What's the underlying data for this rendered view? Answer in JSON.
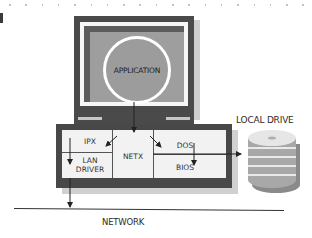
{
  "diagram": {
    "type": "architecture",
    "title": "",
    "nodes": {
      "application": {
        "label": "APPLICATION"
      },
      "ipx": {
        "label": "IPX"
      },
      "lan_driver": {
        "label_line1": "LAN",
        "label_line2": "DRIVER"
      },
      "netx": {
        "label": "NETX"
      },
      "dos": {
        "label": "DOS"
      },
      "bios": {
        "label": "BIOS"
      },
      "local_drive": {
        "label": "LOCAL DRIVE"
      },
      "network": {
        "label": "NETWORK"
      }
    },
    "edges": [
      {
        "from": "APPLICATION",
        "to": "NETX"
      },
      {
        "from": "NETX",
        "to": "IPX"
      },
      {
        "from": "NETX",
        "to": "DOS"
      },
      {
        "from": "IPX",
        "to": "LAN DRIVER"
      },
      {
        "from": "DOS",
        "to": "BIOS"
      },
      {
        "from": "LAN DRIVER",
        "to": "NETWORK"
      },
      {
        "from": "DOS/BIOS",
        "to": "LOCAL DRIVE"
      }
    ],
    "colors": {
      "frame_dark": "#4a4a4a",
      "screen_gray": "#9e9e9e",
      "panel_light": "#f2f2f2",
      "shadow": "#d0d0d0"
    }
  }
}
